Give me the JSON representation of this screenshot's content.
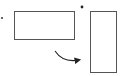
{
  "diagram": {
    "colors": {
      "stroke": "#333333",
      "background": "#ffffff"
    },
    "landscape_rect": {
      "x": 14,
      "y": 11,
      "width": 60,
      "height": 28,
      "marker": {
        "x": 2,
        "y": 18
      }
    },
    "portrait_rect": {
      "x": 90,
      "y": 11,
      "width": 27,
      "height": 62,
      "marker": {
        "x": 82,
        "y": 7
      }
    },
    "rotation_arrow": {
      "direction": "clockwise"
    }
  }
}
